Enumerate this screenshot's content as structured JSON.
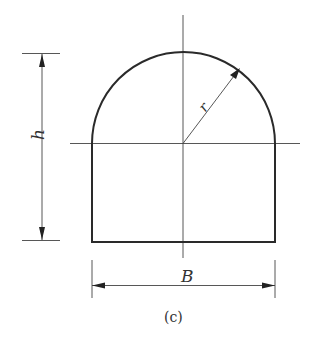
{
  "figure": {
    "caption": "(c)",
    "type": "cross-section",
    "shape": "semicircular arch on rectangle (horseshoe / U-shaped tunnel section)"
  },
  "labels": {
    "height": "h",
    "radius": "r",
    "width": "B"
  },
  "colors": {
    "outline": "#2a2a2a",
    "dimension": "#444444",
    "background": "#ffffff"
  }
}
